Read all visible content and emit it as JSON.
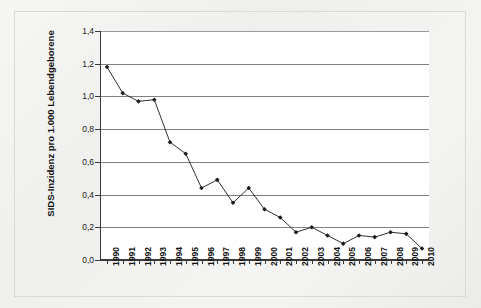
{
  "chart_data": {
    "type": "line",
    "title": "",
    "subtitle": "",
    "xlabel": "",
    "ylabel": "SIDS-Inzidenz pro 1.000 Lebendgeborene",
    "ylim": [
      0.0,
      1.4
    ],
    "ytick_labels": [
      "0,0",
      "0,2",
      "0,4",
      "0,6",
      "0,8",
      "1,0",
      "1,2",
      "1,4"
    ],
    "ytick_values": [
      0.0,
      0.2,
      0.4,
      0.6,
      0.8,
      1.0,
      1.2,
      1.4
    ],
    "grid": "horizontal",
    "legend": "none",
    "marker": "filled-diamond",
    "line_color": "#1a1a1a",
    "grid_color": "#808080",
    "plot_background": "#ffffff",
    "panel_background": "#f1f1ef",
    "categories": [
      "1990",
      "1991",
      "1992",
      "1993",
      "1994",
      "1995",
      "1996",
      "1997",
      "1998",
      "1999",
      "2000",
      "2001",
      "2002",
      "2003",
      "2004",
      "2005",
      "2006",
      "2007",
      "2008",
      "2009",
      "2010"
    ],
    "x": [
      1990,
      1991,
      1992,
      1993,
      1994,
      1995,
      1996,
      1997,
      1998,
      1999,
      2000,
      2001,
      2002,
      2003,
      2004,
      2005,
      2006,
      2007,
      2008,
      2009,
      2010
    ],
    "values": [
      1.18,
      1.02,
      0.97,
      0.98,
      0.72,
      0.65,
      0.44,
      0.49,
      0.35,
      0.44,
      0.31,
      0.26,
      0.17,
      0.2,
      0.15,
      0.1,
      0.15,
      0.14,
      0.17,
      0.16,
      0.07
    ],
    "series": [
      {
        "name": "SIDS-Inzidenz",
        "values": [
          1.18,
          1.02,
          0.97,
          0.98,
          0.72,
          0.65,
          0.44,
          0.49,
          0.35,
          0.44,
          0.31,
          0.26,
          0.17,
          0.2,
          0.15,
          0.1,
          0.15,
          0.14,
          0.17,
          0.16,
          0.07
        ]
      }
    ]
  }
}
